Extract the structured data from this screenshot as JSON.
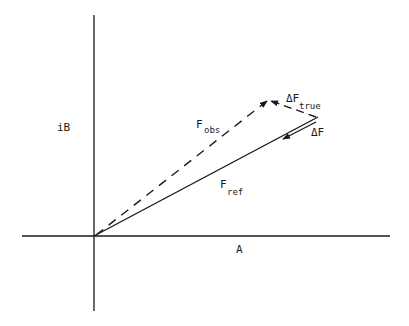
{
  "diagram": {
    "axes": {
      "vertical_label": "iB",
      "horizontal_label": "A"
    },
    "vectors": {
      "f_obs": {
        "base": "F",
        "subscript": "obs",
        "style": "dashed"
      },
      "f_ref": {
        "base": "F",
        "subscript": "ref",
        "style": "solid"
      },
      "delta_f_true": {
        "base": "ΔF",
        "subscript": "true",
        "style": "dashed"
      },
      "delta_f": {
        "base": "ΔF",
        "subscript": "",
        "style": "solid"
      }
    },
    "colors": {
      "line": "#1a1a1a",
      "background": "#ffffff"
    }
  }
}
